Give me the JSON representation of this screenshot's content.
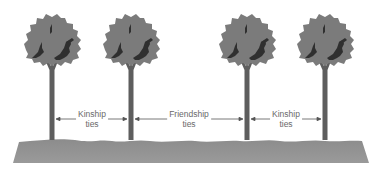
{
  "diagram": {
    "type": "social-ties-illustration",
    "colors": {
      "background": "#ffffff",
      "foliage": "#7b7b7b",
      "foliage_shadow": "#2f2f2f",
      "trunk": "#5e5e5e",
      "ground": "#8a8a8a",
      "arrow": "#555555",
      "label_text": "#6a6a6a"
    },
    "trees": [
      {
        "id": "tree-1",
        "x": 52
      },
      {
        "id": "tree-2",
        "x": 131
      },
      {
        "id": "tree-3",
        "x": 247
      },
      {
        "id": "tree-4",
        "x": 325
      }
    ],
    "ties": [
      {
        "id": "kinship-left",
        "line1": "Kinship",
        "line2": "ties",
        "from": 52,
        "to": 131
      },
      {
        "id": "friendship",
        "line1": "Friendship",
        "line2": "ties",
        "from": 131,
        "to": 247
      },
      {
        "id": "kinship-right",
        "line1": "Kinship",
        "line2": "ties",
        "from": 247,
        "to": 325
      }
    ]
  }
}
